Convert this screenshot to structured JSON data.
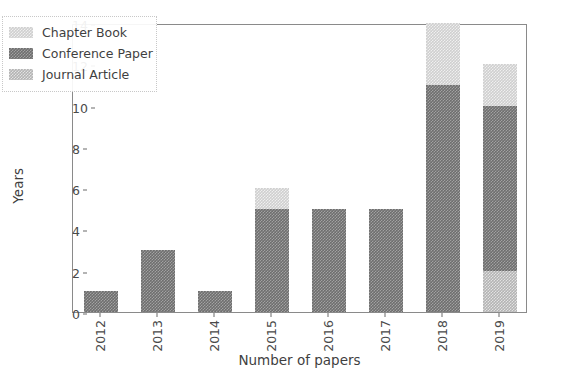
{
  "chart_data": {
    "type": "bar",
    "title": "",
    "subtitle": "",
    "xlabel": "Number of papers",
    "ylabel": "Years",
    "categories": [
      "2012",
      "2013",
      "2014",
      "2015",
      "2016",
      "2017",
      "2018",
      "2019"
    ],
    "ylim": [
      0,
      14
    ],
    "yticks": [
      "0",
      "2",
      "4",
      "6",
      "8",
      "10",
      "12",
      "14"
    ],
    "ytick_values": [
      0,
      2,
      4,
      6,
      8,
      10,
      12,
      14
    ],
    "grid": false,
    "stacked": true,
    "legend_position": "upper left",
    "series": [
      {
        "name": "Journal Article",
        "color": "#b4b4b4",
        "values": [
          0,
          0,
          0,
          0,
          0,
          0,
          0,
          2
        ]
      },
      {
        "name": "Conference Paper",
        "color": "#6e6e6e",
        "values": [
          1,
          3,
          1,
          5,
          5,
          5,
          11,
          8
        ]
      },
      {
        "name": "Chapter Book",
        "color": "#cfcfcf",
        "values": [
          0,
          0,
          0,
          1,
          0,
          0,
          3,
          2
        ]
      }
    ],
    "totals": [
      1,
      3,
      1,
      6,
      5,
      5,
      14,
      12
    ]
  },
  "legend": {
    "entries": [
      {
        "label": "Chapter Book",
        "swatch": "chapter"
      },
      {
        "label": "Conference Paper",
        "swatch": "conference"
      },
      {
        "label": "Journal Article",
        "swatch": "journal"
      }
    ]
  }
}
